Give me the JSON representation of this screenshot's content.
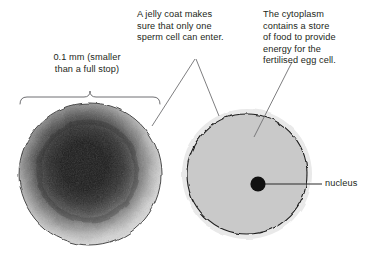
{
  "figure": {
    "background": "#ffffff"
  },
  "labels": {
    "size": "0.1 mm (smaller\nthan a full stop)",
    "jelly_coat": "A jelly coat  makes\nsure that only one\nsperm cell can enter.",
    "cytoplasm": "The cytoplasm\ncontains a store\nof food to provide\nenergy for the\nfertilised egg cell.",
    "nucleus": "nucleus"
  },
  "photo_cell": {
    "name": "egg-cell-photomicrograph",
    "center": [
      90,
      174
    ],
    "radius": 72,
    "core_color": "#0b0b0b",
    "rim_color": "#d6d6d6",
    "outline_color": "#4a4a4a"
  },
  "diagram_cell": {
    "name": "egg-cell-diagram",
    "center": [
      247,
      174
    ],
    "radius": 64,
    "jelly_coat_color": "#e9e9e9",
    "cytoplasm_color": "#c9c9c9",
    "membrane_color": "#1d1d1d",
    "nucleus": {
      "center": [
        258,
        184
      ],
      "radius": 7.5,
      "color": "#111111"
    }
  },
  "annotations": {
    "brace": {
      "name": "size-brace",
      "left_x": 20,
      "right_x": 160,
      "y": 100,
      "tick_x": 90
    },
    "leader_colors": {
      "label_leader": "#6f6f72",
      "nucleus_leader": "#2b2b2b"
    }
  }
}
